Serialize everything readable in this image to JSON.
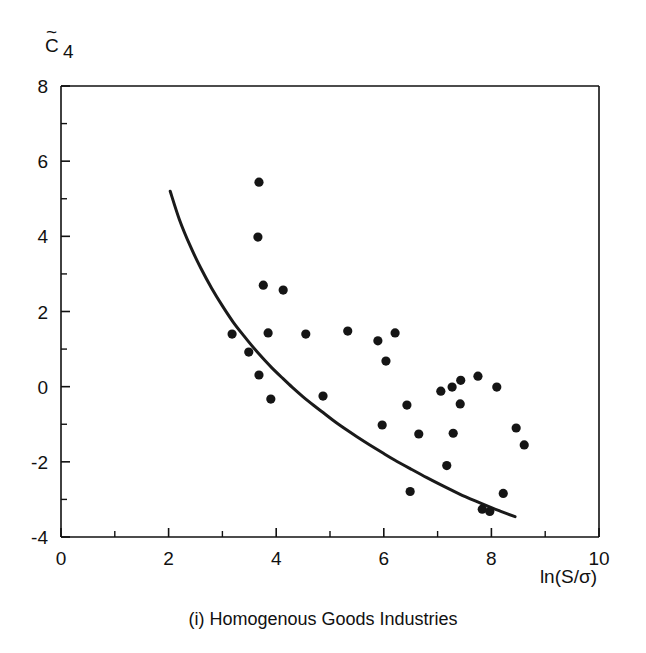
{
  "figure": {
    "caption": "(i) Homogenous Goods Industries",
    "ylabel": "C̄4",
    "ylabel_base": "C",
    "ylabel_sub": "4",
    "xlabel": "ln(S/σ)",
    "point_color": "#151515",
    "curve_color": "#1a1a1a",
    "axis_color": "#111111",
    "background": "#ffffff"
  },
  "chart_data": {
    "type": "scatter",
    "title": "",
    "subtitle": "",
    "caption": "(i) Homogenous Goods Industries",
    "xlabel": "ln(S/σ)",
    "ylabel": "C̄4",
    "xlim": [
      0,
      10
    ],
    "ylim": [
      -4,
      8
    ],
    "xticks": [
      0,
      2,
      4,
      6,
      8,
      10
    ],
    "xtick_labels": [
      "0",
      "2",
      "4",
      "6",
      "8",
      "10"
    ],
    "xminor_ticks": [
      1,
      3,
      5,
      7,
      9
    ],
    "yticks": [
      -4,
      -2,
      0,
      2,
      4,
      6,
      8
    ],
    "ytick_labels": [
      "-4",
      "-2",
      "0",
      "2",
      "4",
      "6",
      "8"
    ],
    "yminor_ticks": [
      -3,
      -1,
      1,
      3,
      5,
      7
    ],
    "grid": false,
    "legend": null,
    "series": [
      {
        "name": "Industry observations",
        "marker": "filled-circle",
        "points": [
          [
            3.68,
            5.44
          ],
          [
            3.66,
            3.98
          ],
          [
            3.76,
            2.7
          ],
          [
            4.13,
            2.57
          ],
          [
            3.18,
            1.4
          ],
          [
            3.85,
            1.43
          ],
          [
            4.55,
            1.4
          ],
          [
            5.33,
            1.48
          ],
          [
            5.89,
            1.22
          ],
          [
            6.21,
            1.43
          ],
          [
            3.49,
            0.92
          ],
          [
            6.04,
            0.68
          ],
          [
            3.68,
            0.31
          ],
          [
            7.43,
            0.17
          ],
          [
            7.75,
            0.28
          ],
          [
            7.27,
            -0.01
          ],
          [
            8.1,
            -0.01
          ],
          [
            7.06,
            -0.12
          ],
          [
            4.87,
            -0.25
          ],
          [
            3.9,
            -0.33
          ],
          [
            7.42,
            -0.46
          ],
          [
            6.43,
            -0.49
          ],
          [
            5.97,
            -1.02
          ],
          [
            8.46,
            -1.1
          ],
          [
            7.29,
            -1.24
          ],
          [
            6.65,
            -1.26
          ],
          [
            8.61,
            -1.55
          ],
          [
            7.17,
            -2.1
          ],
          [
            6.49,
            -2.79
          ],
          [
            8.22,
            -2.84
          ],
          [
            7.83,
            -3.26
          ],
          [
            7.97,
            -3.32
          ]
        ]
      }
    ],
    "curve": {
      "name": "Fitted boundary curve",
      "style": "solid",
      "points": [
        [
          2.03,
          5.2
        ],
        [
          2.2,
          4.45
        ],
        [
          2.4,
          3.75
        ],
        [
          2.6,
          3.15
        ],
        [
          2.8,
          2.62
        ],
        [
          3.0,
          2.15
        ],
        [
          3.2,
          1.72
        ],
        [
          3.4,
          1.35
        ],
        [
          3.6,
          1.0
        ],
        [
          3.8,
          0.68
        ],
        [
          3.92,
          0.5
        ],
        [
          4.1,
          0.25
        ],
        [
          4.3,
          -0.02
        ],
        [
          4.5,
          -0.27
        ],
        [
          4.7,
          -0.5
        ],
        [
          4.9,
          -0.72
        ],
        [
          5.1,
          -0.94
        ],
        [
          5.3,
          -1.14
        ],
        [
          5.5,
          -1.33
        ],
        [
          5.74,
          -1.55
        ],
        [
          6.0,
          -1.78
        ],
        [
          6.2,
          -1.95
        ],
        [
          6.49,
          -2.18
        ],
        [
          6.8,
          -2.42
        ],
        [
          7.1,
          -2.64
        ],
        [
          7.4,
          -2.85
        ],
        [
          7.7,
          -3.04
        ],
        [
          8.0,
          -3.22
        ],
        [
          8.2,
          -3.33
        ],
        [
          8.44,
          -3.46
        ]
      ]
    }
  }
}
